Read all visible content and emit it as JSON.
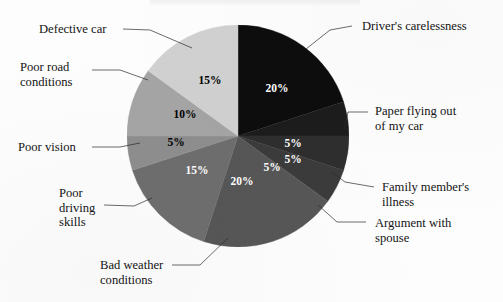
{
  "chart_data": {
    "type": "pie",
    "title": "",
    "xlabel": "",
    "ylabel": "",
    "legend_position": "callout-labels",
    "grid": false,
    "total": 100,
    "value_suffix": "%",
    "categories": [
      "Driver's carelessness",
      "Paper flying out of my car",
      "Family member's illness",
      "Argument with spouse",
      "Bad weather conditions",
      "Poor driving skills",
      "Poor vision",
      "Poor road conditions",
      "Defective car"
    ],
    "values": [
      20,
      5,
      5,
      5,
      20,
      15,
      5,
      10,
      15
    ],
    "value_labels": [
      "20%",
      "5%",
      "5%",
      "5%",
      "20%",
      "15%",
      "5%",
      "10%",
      "15%"
    ],
    "colors": [
      "#0a0a0a",
      "#1f1f1f",
      "#2e2e2e",
      "#3b3b3b",
      "#585858",
      "#6f6f6f",
      "#8f8f8f",
      "#a6a6a6",
      "#d2d2d2"
    ],
    "start_angle_deg": 0,
    "direction": "clockwise",
    "center": {
      "x": 238,
      "y": 136
    },
    "radius": 111
  },
  "slice_value_positions": [
    {
      "label": "20%",
      "x": 277,
      "y": 89,
      "tone": "on-dark"
    },
    {
      "label": "5%",
      "x": 293,
      "y": 144,
      "tone": "on-dark"
    },
    {
      "label": "5%",
      "x": 293,
      "y": 160,
      "tone": "on-dark"
    },
    {
      "label": "5%",
      "x": 272,
      "y": 168,
      "tone": "on-dark"
    },
    {
      "label": "20%",
      "x": 242,
      "y": 182,
      "tone": "on-dark"
    },
    {
      "label": "15%",
      "x": 197,
      "y": 171,
      "tone": "on-dark"
    },
    {
      "label": "5%",
      "x": 176,
      "y": 143,
      "tone": "on-light"
    },
    {
      "label": "10%",
      "x": 185,
      "y": 115,
      "tone": "on-light"
    },
    {
      "label": "15%",
      "x": 210,
      "y": 81,
      "tone": "on-light"
    }
  ],
  "callouts": {
    "right": [
      {
        "name": "drivers-carelessness",
        "text": "Driver's carelessness",
        "x": 362,
        "y": 19,
        "leader": {
          "x1": 352,
          "y1": 26,
          "x2": 330,
          "y2": 30,
          "x3": 306,
          "y3": 49
        }
      },
      {
        "name": "paper-flying-out-of-my-car",
        "text": "Paper flying out\nof my car",
        "x": 375,
        "y": 104,
        "leader": {
          "x1": 368,
          "y1": 112,
          "x2": 348,
          "y2": 112,
          "x3": 344,
          "y3": 130
        }
      },
      {
        "name": "family-members-illness",
        "text": "Family member's\nillness",
        "x": 382,
        "y": 180,
        "leader": {
          "x1": 374,
          "y1": 187,
          "x2": 345,
          "y2": 182,
          "x3": 332,
          "y3": 172
        }
      },
      {
        "name": "argument-with-spouse",
        "text": "Argument with\nspouse",
        "x": 375,
        "y": 216,
        "leader": {
          "x1": 366,
          "y1": 222,
          "x2": 337,
          "y2": 222,
          "x3": 318,
          "y3": 205
        }
      }
    ],
    "left": [
      {
        "name": "defective-car",
        "text": "Defective car",
        "x": 39,
        "y": 22,
        "leader": {
          "x1": 123,
          "y1": 29,
          "x2": 150,
          "y2": 30,
          "x3": 192,
          "y3": 48
        }
      },
      {
        "name": "poor-road-conditions",
        "text": "Poor road\nconditions",
        "x": 20,
        "y": 60,
        "leader": {
          "x1": 92,
          "y1": 70,
          "x2": 120,
          "y2": 70,
          "x3": 148,
          "y3": 80
        }
      },
      {
        "name": "poor-vision",
        "text": "Poor vision",
        "x": 18,
        "y": 140,
        "leader": {
          "x1": 92,
          "y1": 147,
          "x2": 120,
          "y2": 147,
          "x3": 140,
          "y3": 143
        }
      },
      {
        "name": "poor-driving-skills",
        "text": "Poor\ndriving\nskills",
        "x": 59,
        "y": 186,
        "leader": {
          "x1": 104,
          "y1": 205,
          "x2": 134,
          "y2": 206,
          "x3": 152,
          "y3": 198
        }
      },
      {
        "name": "bad-weather-conditions",
        "text": "Bad weather\nconditions",
        "x": 100,
        "y": 258,
        "leader": {
          "x1": 172,
          "y1": 265,
          "x2": 200,
          "y2": 265,
          "x3": 228,
          "y3": 238
        }
      }
    ]
  }
}
